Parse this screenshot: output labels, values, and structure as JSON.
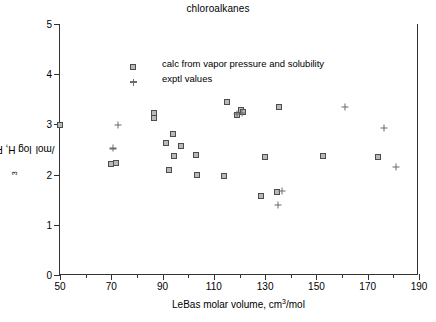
{
  "chart_data": {
    "type": "scatter",
    "title": "chloroalkanes",
    "xlabel": "LeBas molar volume, cm3/mol",
    "xlabel_parts": {
      "pre": "LeBas molar volume, cm",
      "sup": "3",
      "post": "/mol"
    },
    "ylabel": "log H, Pa m3/mol",
    "ylabel_parts": {
      "pre": "log H, Pa m",
      "sup": "3",
      "post": "/mol"
    },
    "xlim": [
      50,
      190
    ],
    "ylim": [
      0,
      5
    ],
    "xticks": [
      50,
      70,
      90,
      110,
      130,
      150,
      170,
      190
    ],
    "xticks_minor": [
      60,
      80,
      100,
      120,
      140,
      160,
      180
    ],
    "yticks": [
      0,
      1,
      2,
      3,
      4,
      5
    ],
    "grid": false,
    "legend_position": "top-left inside",
    "series": [
      {
        "name": "calc from vapor pressure and solubility",
        "marker": "square",
        "color": "#b9b9b9",
        "edge_color": "#4c4c4c",
        "points": [
          [
            50.0,
            2.99
          ],
          [
            70.0,
            2.22
          ],
          [
            72.0,
            2.24
          ],
          [
            86.5,
            3.22
          ],
          [
            86.5,
            3.12
          ],
          [
            91.5,
            2.62
          ],
          [
            92.5,
            2.09
          ],
          [
            94.5,
            2.38
          ],
          [
            94.0,
            2.8
          ],
          [
            97.0,
            2.56
          ],
          [
            103.0,
            2.4
          ],
          [
            103.5,
            1.99
          ],
          [
            114.0,
            1.98
          ],
          [
            115.0,
            3.45
          ],
          [
            119.0,
            3.18
          ],
          [
            120.5,
            3.28
          ],
          [
            121.5,
            3.24
          ],
          [
            128.5,
            1.58
          ],
          [
            130.0,
            2.36
          ],
          [
            134.5,
            1.66
          ],
          [
            135.5,
            3.34
          ],
          [
            152.5,
            2.38
          ],
          [
            174.0,
            2.36
          ]
        ]
      },
      {
        "name": "exptl values",
        "marker": "plus",
        "color": "#6b6b6b",
        "points": [
          [
            72.5,
            2.99
          ],
          [
            70.5,
            2.52
          ],
          [
            119.0,
            3.2
          ],
          [
            121.0,
            3.22
          ],
          [
            136.5,
            1.68
          ],
          [
            135.0,
            1.4
          ],
          [
            161.0,
            3.35
          ],
          [
            176.5,
            2.92
          ],
          [
            181.0,
            2.15
          ]
        ]
      }
    ]
  },
  "legend": {
    "items": [
      {
        "label": "calc from vapor pressure and solubility",
        "marker": "square"
      },
      {
        "label": "exptl values",
        "marker": "plus"
      }
    ]
  }
}
